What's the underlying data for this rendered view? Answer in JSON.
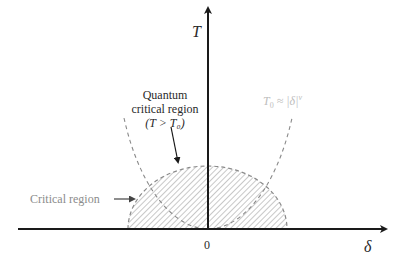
{
  "diagram": {
    "type": "phase-diagram",
    "axes": {
      "y_label": "T",
      "x_label": "δ",
      "origin_label": "0"
    },
    "labels": {
      "quantum_critical": {
        "line1": "Quantum",
        "line2": "critical region",
        "line3": "(T > T₀)"
      },
      "critical_region": "Critical region",
      "crossover": {
        "T0": "T",
        "sub": "0",
        "rest": " ≈ |δ|",
        "exp": "ν"
      }
    },
    "colors": {
      "axis": "#1a1a1a",
      "dashed": "#8a8a8a",
      "hatch": "#9a9a9a",
      "muted_text": "#8c8c8c",
      "light_text": "#bdbdbd",
      "text": "#2a2a2a"
    }
  }
}
